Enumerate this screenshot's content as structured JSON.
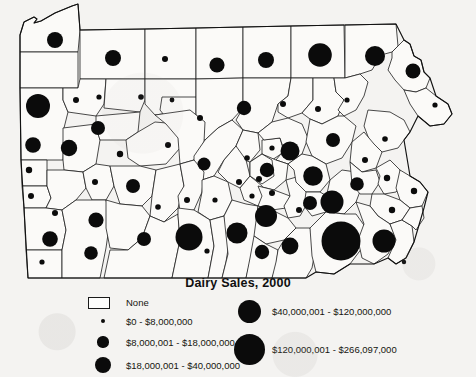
{
  "title": "Dairy Sales, 2000",
  "map": {
    "name": "pennsylvania-county-map",
    "region": "Pennsylvania",
    "symbol_type": "graduated-circle",
    "colors": {
      "symbol": "#0b0b0b",
      "county_fill": "#fbfaf8",
      "county_stroke": "#1d1d1d",
      "background": "#f4f3f1"
    }
  },
  "legend": {
    "left_column": [
      {
        "id": "none",
        "symbol": "box",
        "radius": 0,
        "label": "None"
      },
      {
        "id": "b1",
        "symbol": "circle",
        "radius": 2.4,
        "label": "$0 - $8,000,000"
      },
      {
        "id": "b2",
        "symbol": "circle",
        "radius": 5.6,
        "label": "$8,000,001 - $18,000,000"
      },
      {
        "id": "b3",
        "symbol": "circle",
        "radius": 8.2,
        "label": "$18,000,001 - $40,000,000"
      }
    ],
    "right_column": [
      {
        "id": "b4",
        "symbol": "circle",
        "radius": 11.5,
        "label": "$40,000,001 - $120,000,000"
      },
      {
        "id": "b5",
        "symbol": "circle",
        "radius": 15.5,
        "label": "$120,000,001 - $266,097,000"
      }
    ]
  },
  "chart_data": {
    "type": "map",
    "title": "Dairy Sales, 2000",
    "subtype": "graduated-symbol choropleth",
    "region": "Pennsylvania counties",
    "value_units": "USD",
    "classes": [
      {
        "label": "None",
        "min": null,
        "max": null,
        "radius": 0
      },
      {
        "label": "$0 - $8,000,000",
        "min": 0,
        "max": 8000000,
        "radius": 2.4
      },
      {
        "label": "$8,000,001 - $18,000,000",
        "min": 8000001,
        "max": 18000000,
        "radius": 5.6
      },
      {
        "label": "$18,000,001 - $40,000,000",
        "min": 18000001,
        "max": 40000000,
        "radius": 8.2
      },
      {
        "label": "$40,000,001 - $120,000,000",
        "min": 40000001,
        "max": 120000000,
        "radius": 11.5
      },
      {
        "label": "$120,000,001 - $266,097,000",
        "min": 120000001,
        "max": 266097000,
        "radius": 15.5
      }
    ],
    "symbols": [
      {
        "county": "Erie",
        "x": 55,
        "y": 40,
        "r": 8.0,
        "class": "$18,000,001 - $40,000,000"
      },
      {
        "county": "Warren",
        "x": 113,
        "y": 58,
        "r": 8.0,
        "class": "$18,000,001 - $40,000,000"
      },
      {
        "county": "McKean",
        "x": 165,
        "y": 59,
        "r": 3.0,
        "class": "$0 - $8,000,000"
      },
      {
        "county": "Potter",
        "x": 217,
        "y": 65,
        "r": 7.6,
        "class": "$18,000,001 - $40,000,000"
      },
      {
        "county": "Tioga",
        "x": 266,
        "y": 60,
        "r": 8.0,
        "class": "$18,000,001 - $40,000,000"
      },
      {
        "county": "Bradford",
        "x": 320,
        "y": 55,
        "r": 11.8,
        "class": "$40,000,001 - $120,000,000"
      },
      {
        "county": "Susquehanna",
        "x": 375,
        "y": 56,
        "r": 10.0,
        "class": "$40,000,001 - $120,000,000"
      },
      {
        "county": "Wayne",
        "x": 413,
        "y": 71,
        "r": 7.5,
        "class": "$18,000,001 - $40,000,000"
      },
      {
        "county": "Crawford",
        "x": 38,
        "y": 106,
        "r": 12.0,
        "class": "$40,000,001 - $120,000,000"
      },
      {
        "county": "Venango",
        "x": 76,
        "y": 100,
        "r": 3.0,
        "class": "$0 - $8,000,000"
      },
      {
        "county": "Forest",
        "x": 99,
        "y": 97,
        "r": 2.6,
        "class": "$0 - $8,000,000"
      },
      {
        "county": "Elk",
        "x": 141,
        "y": 97,
        "r": 2.8,
        "class": "$0 - $8,000,000"
      },
      {
        "county": "Cameron",
        "x": 172,
        "y": 100,
        "r": 2.4,
        "class": "$0 - $8,000,000"
      },
      {
        "county": "Clinton",
        "x": 200,
        "y": 118,
        "r": 3.0,
        "class": "$0 - $8,000,000"
      },
      {
        "county": "Lycoming",
        "x": 244,
        "y": 108,
        "r": 7.2,
        "class": "$18,000,001 - $40,000,000"
      },
      {
        "county": "Sullivan",
        "x": 283,
        "y": 104,
        "r": 3.0,
        "class": "$0 - $8,000,000"
      },
      {
        "county": "Wyoming",
        "x": 318,
        "y": 109,
        "r": 3.0,
        "class": "$0 - $8,000,000"
      },
      {
        "county": "Lackawanna",
        "x": 347,
        "y": 100,
        "r": 2.6,
        "class": "$0 - $8,000,000"
      },
      {
        "county": "Pike",
        "x": 435,
        "y": 105,
        "r": 2.6,
        "class": "$0 - $8,000,000"
      },
      {
        "county": "Mercer",
        "x": 33,
        "y": 145,
        "r": 7.8,
        "class": "$18,000,001 - $40,000,000"
      },
      {
        "county": "Butler",
        "x": 69,
        "y": 148,
        "r": 8.2,
        "class": "$18,000,001 - $40,000,000"
      },
      {
        "county": "Clarion",
        "x": 98,
        "y": 128,
        "r": 7.0,
        "class": "$18,000,001 - $40,000,000"
      },
      {
        "county": "Jefferson",
        "x": 120,
        "y": 154,
        "r": 3.2,
        "class": "$0 - $8,000,000"
      },
      {
        "county": "Clearfield",
        "x": 168,
        "y": 145,
        "r": 3.0,
        "class": "$0 - $8,000,000"
      },
      {
        "county": "Centre",
        "x": 204,
        "y": 164,
        "r": 6.5,
        "class": "$18,000,001 - $40,000,000"
      },
      {
        "county": "Union",
        "x": 247,
        "y": 158,
        "r": 2.8,
        "class": "$0 - $8,000,000"
      },
      {
        "county": "Northumberland",
        "x": 267,
        "y": 170,
        "r": 7.2,
        "class": "$18,000,001 - $40,000,000"
      },
      {
        "county": "Columbia",
        "x": 290,
        "y": 151,
        "r": 9.5,
        "class": "$18,000,001 - $40,000,000"
      },
      {
        "county": "Luzerne",
        "x": 333,
        "y": 140,
        "r": 7.0,
        "class": "$18,000,001 - $40,000,000"
      },
      {
        "county": "Monroe",
        "x": 385,
        "y": 139,
        "r": 2.8,
        "class": "$0 - $8,000,000"
      },
      {
        "county": "Carbon",
        "x": 365,
        "y": 160,
        "r": 3.0,
        "class": "$0 - $8,000,000"
      },
      {
        "county": "Lawrence",
        "x": 29,
        "y": 170,
        "r": 3.2,
        "class": "$0 - $8,000,000"
      },
      {
        "county": "Armstrong",
        "x": 95,
        "y": 182,
        "r": 3.0,
        "class": "$0 - $8,000,000"
      },
      {
        "county": "Indiana",
        "x": 133,
        "y": 186,
        "r": 7.0,
        "class": "$18,000,001 - $40,000,000"
      },
      {
        "county": "Cambria",
        "x": 158,
        "y": 207,
        "r": 2.8,
        "class": "$0 - $8,000,000"
      },
      {
        "county": "Blair",
        "x": 187,
        "y": 200,
        "r": 3.0,
        "class": "$0 - $8,000,000"
      },
      {
        "county": "Huntingdon",
        "x": 215,
        "y": 200,
        "r": 2.6,
        "class": "$0 - $8,000,000"
      },
      {
        "county": "Mifflin",
        "x": 239,
        "y": 182,
        "r": 3.0,
        "class": "$0 - $8,000,000"
      },
      {
        "county": "Snyder",
        "x": 259,
        "y": 179,
        "r": 3.0,
        "class": "$0 - $8,000,000"
      },
      {
        "county": "Schuylkill",
        "x": 313,
        "y": 176,
        "r": 9.8,
        "class": "$18,000,001 - $40,000,000"
      },
      {
        "county": "Lehigh",
        "x": 357,
        "y": 184,
        "r": 6.8,
        "class": "$18,000,001 - $40,000,000"
      },
      {
        "county": "Northampton",
        "x": 387,
        "y": 178,
        "r": 3.2,
        "class": "$0 - $8,000,000"
      },
      {
        "county": "Beaver",
        "x": 31,
        "y": 196,
        "r": 3.0,
        "class": "$0 - $8,000,000"
      },
      {
        "county": "Allegheny",
        "x": 55,
        "y": 213,
        "r": 3.0,
        "class": "$0 - $8,000,000"
      },
      {
        "county": "Westmoreland",
        "x": 96,
        "y": 220,
        "r": 7.6,
        "class": "$18,000,001 - $40,000,000"
      },
      {
        "county": "Somerset",
        "x": 144,
        "y": 239,
        "r": 7.0,
        "class": "$18,000,001 - $40,000,000"
      },
      {
        "county": "Bedford",
        "x": 189,
        "y": 237,
        "r": 13.5,
        "class": "$40,000,001 - $120,000,000"
      },
      {
        "county": "Franklin",
        "x": 237,
        "y": 233,
        "r": 10.5,
        "class": "$40,000,001 - $120,000,000"
      },
      {
        "county": "Cumberland",
        "x": 266,
        "y": 216,
        "r": 11.0,
        "class": "$40,000,001 - $120,000,000"
      },
      {
        "county": "Perry",
        "x": 272,
        "y": 193,
        "r": 3.0,
        "class": "$0 - $8,000,000"
      },
      {
        "county": "Dauphin",
        "x": 299,
        "y": 210,
        "r": 3.0,
        "class": "$0 - $8,000,000"
      },
      {
        "county": "Lebanon",
        "x": 310,
        "y": 203,
        "r": 7.0,
        "class": "$18,000,001 - $40,000,000"
      },
      {
        "county": "Berks",
        "x": 332,
        "y": 202,
        "r": 11.5,
        "class": "$40,000,001 - $120,000,000"
      },
      {
        "county": "Lancaster",
        "x": 341,
        "y": 241,
        "r": 19.5,
        "class": "$120,000,001 - $266,097,000"
      },
      {
        "county": "York",
        "x": 290,
        "y": 246,
        "r": 8.4,
        "class": "$18,000,001 - $40,000,000"
      },
      {
        "county": "Adams",
        "x": 262,
        "y": 252,
        "r": 7.2,
        "class": "$18,000,001 - $40,000,000"
      },
      {
        "county": "Chester",
        "x": 384,
        "y": 241,
        "r": 11.5,
        "class": "$40,000,001 - $120,000,000"
      },
      {
        "county": "Montgomery",
        "x": 392,
        "y": 210,
        "r": 3.2,
        "class": "$0 - $8,000,000"
      },
      {
        "county": "Bucks",
        "x": 414,
        "y": 191,
        "r": 3.2,
        "class": "$0 - $8,000,000"
      },
      {
        "county": "Delaware",
        "x": 404,
        "y": 262,
        "r": 2.2,
        "class": "$0 - $8,000,000"
      },
      {
        "county": "Fayette",
        "x": 91,
        "y": 253,
        "r": 6.8,
        "class": "$18,000,001 - $40,000,000"
      },
      {
        "county": "Greene",
        "x": 42,
        "y": 262,
        "r": 2.6,
        "class": "$0 - $8,000,000"
      },
      {
        "county": "Washington",
        "x": 50,
        "y": 239,
        "r": 7.8,
        "class": "$18,000,001 - $40,000,000"
      },
      {
        "county": "Fulton",
        "x": 207,
        "y": 251,
        "r": 2.6,
        "class": "$0 - $8,000,000"
      },
      {
        "county": "Juniata",
        "x": 252,
        "y": 196,
        "r": 2.6,
        "class": "$0 - $8,000,000"
      },
      {
        "county": "Montour",
        "x": 272,
        "y": 148,
        "r": 2.6,
        "class": "$0 - $8,000,000"
      }
    ]
  }
}
